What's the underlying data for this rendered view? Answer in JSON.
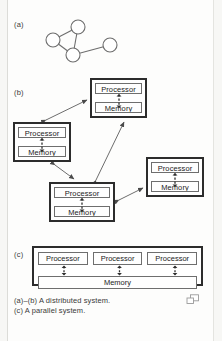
{
  "figure": {
    "panels": [
      {
        "key": "a",
        "label": "(a)"
      },
      {
        "key": "b",
        "label": "(b)"
      },
      {
        "key": "c",
        "label": "(c)"
      }
    ],
    "caption_lines": [
      "(a)–(b) A distributed system.",
      "(c) A parallel system."
    ],
    "corner_icon": "overlapping-rectangles-icon",
    "colors": {
      "page_background": "#fdfdfc",
      "outer_background": "#f7f7f5",
      "node_border": "#2c2c2c",
      "cell_border": "#6e6e6e",
      "text": "#1c1c1c",
      "connector": "#4a4a4a"
    }
  },
  "panel_a": {
    "label": "(a)",
    "type": "node-graph",
    "nodes": [
      {
        "id": "n1",
        "cx": 42,
        "cy": 15,
        "r": 7
      },
      {
        "id": "n2",
        "cx": 17,
        "cy": 28,
        "r": 7
      },
      {
        "id": "n3",
        "cx": 37,
        "cy": 43,
        "r": 7
      },
      {
        "id": "n4",
        "cx": 74,
        "cy": 33,
        "r": 7
      }
    ],
    "edges": [
      {
        "from": "n1",
        "to": "n2"
      },
      {
        "from": "n1",
        "to": "n3"
      },
      {
        "from": "n2",
        "to": "n3"
      },
      {
        "from": "n3",
        "to": "n4"
      }
    ]
  },
  "panel_b": {
    "label": "(b)",
    "type": "distributed-system",
    "unit_labels": {
      "processor": "Processor",
      "memory": "Memory"
    },
    "nodes": [
      {
        "id": "node-top",
        "x": 90,
        "y": 78,
        "w": 57,
        "h": 40,
        "processor": "Processor",
        "memory": "Memory"
      },
      {
        "id": "node-left",
        "x": 13,
        "y": 122,
        "w": 58,
        "h": 40,
        "processor": "Processor",
        "memory": "Memory"
      },
      {
        "id": "node-center",
        "x": 49,
        "y": 182,
        "w": 66,
        "h": 40,
        "processor": "Processor",
        "memory": "Memory"
      },
      {
        "id": "node-right",
        "x": 146,
        "y": 157,
        "w": 58,
        "h": 40,
        "processor": "Processor",
        "memory": "Memory"
      }
    ],
    "links": [
      {
        "from": "node-left",
        "to": "node-top",
        "style": "double-arrow"
      },
      {
        "from": "node-center",
        "to": "node-top",
        "style": "double-arrow"
      },
      {
        "from": "node-left",
        "to": "node-center",
        "style": "double-arrow"
      },
      {
        "from": "node-center",
        "to": "node-right",
        "style": "double-arrow"
      }
    ]
  },
  "panel_c": {
    "label": "(c)",
    "type": "parallel-system",
    "processors": [
      "Processor",
      "Processor",
      "Processor"
    ],
    "memory": "Memory"
  }
}
